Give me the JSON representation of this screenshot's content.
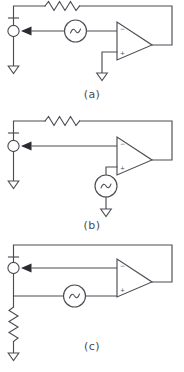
{
  "figure": {
    "background_color": "#ffffff",
    "line_color": "#4d4d55",
    "arrow_color": "#2b2b31"
  },
  "panels": [
    {
      "id": "a",
      "caption": "(a)",
      "description": "Inverting op-amp with feedback resistor; AC source in series with inverting input; non-inverting input grounded",
      "components": [
        {
          "name": "feedback-resistor",
          "type": "resistor",
          "orientation": "horizontal"
        },
        {
          "name": "ac-source",
          "type": "ac-voltage-source",
          "symbol": "~",
          "orientation": "horizontal"
        },
        {
          "name": "opamp",
          "type": "operational-amplifier",
          "inverting_pin": "-",
          "noninverting_pin": "+"
        },
        {
          "name": "output-node",
          "type": "terminal-node"
        },
        {
          "name": "node-ground",
          "type": "ground",
          "symbol": "triangle"
        },
        {
          "name": "opamp-plus-ground",
          "type": "ground",
          "symbol": "triangle"
        },
        {
          "name": "current-arrow",
          "type": "arrow",
          "direction": "left"
        }
      ]
    },
    {
      "id": "b",
      "caption": "(b)",
      "description": "Op-amp with feedback resistor; AC source connected to the non-inverting input and referenced to ground",
      "components": [
        {
          "name": "feedback-resistor",
          "type": "resistor",
          "orientation": "horizontal"
        },
        {
          "name": "ac-source",
          "type": "ac-voltage-source",
          "symbol": "~",
          "orientation": "vertical"
        },
        {
          "name": "opamp",
          "type": "operational-amplifier",
          "inverting_pin": "-",
          "noninverting_pin": "+"
        },
        {
          "name": "output-node",
          "type": "terminal-node"
        },
        {
          "name": "node-ground",
          "type": "ground",
          "symbol": "triangle"
        },
        {
          "name": "source-ground",
          "type": "ground",
          "symbol": "triangle"
        },
        {
          "name": "current-arrow",
          "type": "arrow",
          "direction": "left"
        }
      ]
    },
    {
      "id": "c",
      "caption": "(c)",
      "description": "Op-amp with direct feedback wire; AC source feeding the non-inverting input; vertical resistor from node to ground",
      "components": [
        {
          "name": "feedback-wire",
          "type": "wire",
          "orientation": "horizontal"
        },
        {
          "name": "ac-source",
          "type": "ac-voltage-source",
          "symbol": "~",
          "orientation": "horizontal"
        },
        {
          "name": "opamp",
          "type": "operational-amplifier",
          "inverting_pin": "-",
          "noninverting_pin": "+"
        },
        {
          "name": "output-node",
          "type": "terminal-node"
        },
        {
          "name": "load-resistor",
          "type": "resistor",
          "orientation": "vertical"
        },
        {
          "name": "resistor-ground",
          "type": "ground",
          "symbol": "triangle"
        },
        {
          "name": "current-arrow",
          "type": "arrow",
          "direction": "left"
        }
      ]
    }
  ],
  "pin_labels": {
    "inverting": "−",
    "noninverting": "+"
  }
}
